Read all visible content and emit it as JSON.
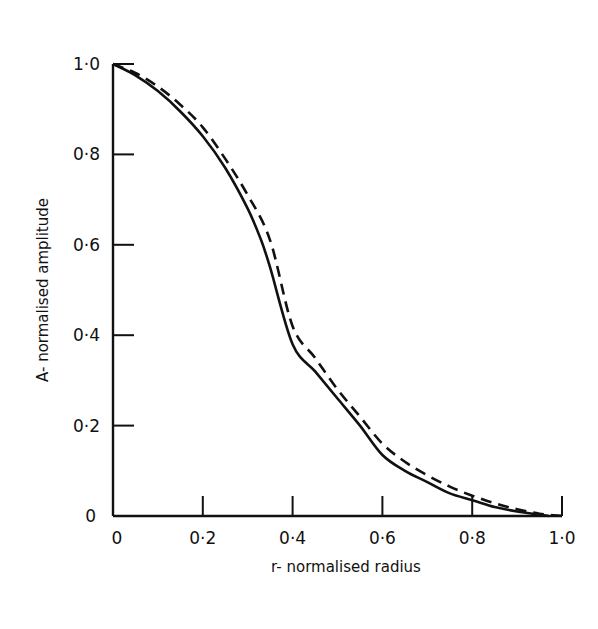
{
  "chart_data": {
    "type": "line",
    "title": "",
    "xlabel": "r- normalised radius",
    "ylabel": "A- normalised amplitude",
    "xlim": [
      0,
      1.0
    ],
    "ylim": [
      0,
      1.0
    ],
    "grid": false,
    "legend": null,
    "x_ticks": [
      0,
      0.2,
      0.4,
      0.6,
      0.8,
      1.0
    ],
    "x_tick_labels": [
      "0",
      "0·2",
      "0·4",
      "0·6",
      "0·8",
      "1·0"
    ],
    "y_ticks": [
      0,
      0.2,
      0.4,
      0.6,
      0.8,
      1.0
    ],
    "y_tick_labels": [
      "0",
      "0·2",
      "0·4",
      "0·6",
      "0·8",
      "1·0"
    ],
    "series": [
      {
        "name": "solid",
        "style": "solid",
        "color": "#111111",
        "x": [
          0,
          0.05,
          0.1,
          0.15,
          0.2,
          0.25,
          0.3,
          0.33,
          0.35,
          0.4,
          0.45,
          0.5,
          0.55,
          0.6,
          0.65,
          0.7,
          0.75,
          0.8,
          0.85,
          0.9,
          0.95,
          0.97
        ],
        "y": [
          1.0,
          0.975,
          0.94,
          0.895,
          0.84,
          0.77,
          0.68,
          0.61,
          0.55,
          0.38,
          0.32,
          0.26,
          0.2,
          0.135,
          0.1,
          0.075,
          0.05,
          0.035,
          0.02,
          0.01,
          0.003,
          0.0
        ]
      },
      {
        "name": "dashed",
        "style": "dashed",
        "color": "#111111",
        "x": [
          0,
          0.05,
          0.1,
          0.15,
          0.2,
          0.25,
          0.3,
          0.35,
          0.4,
          0.45,
          0.5,
          0.55,
          0.6,
          0.65,
          0.7,
          0.75,
          0.8,
          0.85,
          0.9,
          0.95,
          1.0
        ],
        "y": [
          1.0,
          0.98,
          0.95,
          0.91,
          0.86,
          0.79,
          0.71,
          0.61,
          0.42,
          0.35,
          0.28,
          0.22,
          0.16,
          0.12,
          0.09,
          0.065,
          0.045,
          0.028,
          0.015,
          0.005,
          0.0
        ]
      }
    ]
  },
  "axes": {
    "xlabel": "r- normalised radius",
    "ylabel": "A- normalised amplitude"
  }
}
